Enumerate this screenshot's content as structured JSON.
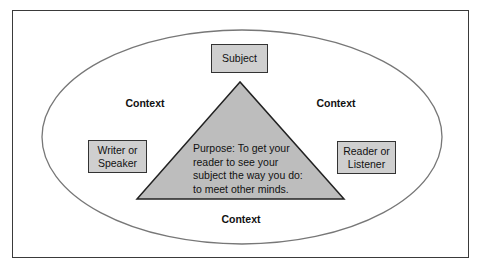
{
  "diagram": {
    "subject_label": "Subject",
    "writer_label_lines": [
      "Writer or",
      "Speaker"
    ],
    "reader_label_lines": [
      "Reader or",
      "Listener"
    ],
    "context_labels": {
      "left": "Context",
      "right": "Context",
      "bottom": "Context"
    },
    "purpose_lines": [
      "Purpose: To get your",
      "reader to see your",
      "subject the way you do:",
      "to meet other minds."
    ],
    "colors": {
      "box_fill": "#cfcfcf",
      "triangle_fill": "#bdbdbd",
      "stroke": "#333333",
      "ellipse_stroke": "#777777"
    }
  }
}
